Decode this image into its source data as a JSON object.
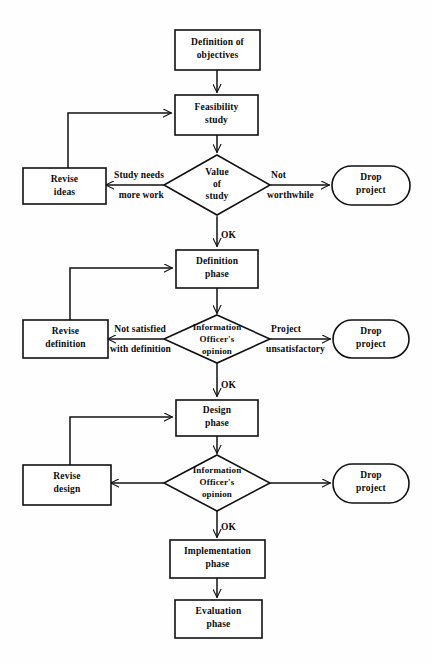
{
  "diagram": {
    "type": "flowchart",
    "background_color": "#fefefe",
    "line_color": "#111111",
    "text_color": "#0b0b0b"
  },
  "nodes": {
    "definition_of_objectives": {
      "line1": "Definition of",
      "line2": "objectives",
      "shape": "rectangle"
    },
    "feasibility_study": {
      "line1": "Feasibility",
      "line2": "study",
      "shape": "rectangle"
    },
    "value_of_study": {
      "line1": "Value",
      "line2": "of",
      "line3": "study",
      "shape": "diamond"
    },
    "revise_ideas": {
      "line1": "Revise",
      "line2": "ideas",
      "shape": "rectangle"
    },
    "drop_project_1": {
      "line1": "Drop",
      "line2": "project",
      "shape": "stadium"
    },
    "definition_phase": {
      "line1": "Definition",
      "line2": "phase",
      "shape": "rectangle"
    },
    "information_officer_opinion_1": {
      "line1": "Information",
      "line2": "Officer's",
      "line3": "opinion",
      "shape": "diamond"
    },
    "revise_definition": {
      "line1": "Revise",
      "line2": "definition",
      "shape": "rectangle"
    },
    "drop_project_2": {
      "line1": "Drop",
      "line2": "project",
      "shape": "stadium"
    },
    "design_phase": {
      "line1": "Design",
      "line2": "phase",
      "shape": "rectangle"
    },
    "information_officer_opinion_2": {
      "line1": "Information",
      "line2": "Officer's",
      "line3": "opinion",
      "shape": "diamond"
    },
    "revise_design": {
      "line1": "Revise",
      "line2": "design",
      "shape": "rectangle"
    },
    "drop_project_3": {
      "line1": "Drop",
      "line2": "project",
      "shape": "stadium"
    },
    "implementation_phase": {
      "line1": "Implementation",
      "line2": "phase",
      "shape": "rectangle"
    },
    "evaluation_phase": {
      "line1": "Evaluation",
      "line2": "phase",
      "shape": "rectangle"
    }
  },
  "edge_labels": {
    "study_needs_more_work": {
      "line1": "Study needs",
      "line2": "more work"
    },
    "not_worthwhile": {
      "line1": "Not",
      "line2": "worthwhile"
    },
    "ok_1": {
      "text": "OK"
    },
    "not_satisfied_with_definition": {
      "line1": "Not satisfied",
      "line2": "with definition"
    },
    "project_unsatisfactory": {
      "line1": "Project",
      "line2": "unsatisfactory"
    },
    "ok_2": {
      "text": "OK"
    },
    "ok_3": {
      "text": "OK"
    }
  }
}
